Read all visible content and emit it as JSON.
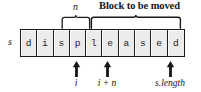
{
  "figure": {
    "kind": "string-array-block-diagram",
    "string_label": "s",
    "string_value": "displeased",
    "cells": [
      {
        "index": 0,
        "char": "d"
      },
      {
        "index": 1,
        "char": "i"
      },
      {
        "index": 2,
        "char": "s"
      },
      {
        "index": 3,
        "char": "p"
      },
      {
        "index": 4,
        "char": "l"
      },
      {
        "index": 5,
        "char": "e"
      },
      {
        "index": 6,
        "char": "a"
      },
      {
        "index": 7,
        "char": "s"
      },
      {
        "index": 8,
        "char": "e"
      },
      {
        "index": 9,
        "char": "d"
      }
    ],
    "braces": [
      {
        "name": "n-span",
        "label": "n",
        "style": "italic",
        "spans_cells": [
          3,
          4
        ]
      },
      {
        "name": "block-span",
        "label": "Block to be moved",
        "style": "bold",
        "spans_cells": [
          5,
          6,
          7,
          8,
          9
        ]
      }
    ],
    "markers": [
      {
        "name": "i",
        "label": "i",
        "at_cell_boundary": 3
      },
      {
        "name": "i-plus-n",
        "label": "i + n",
        "at_cell_boundary": 5
      },
      {
        "name": "s-length",
        "label": "s.length",
        "at_cell_boundary": 10
      }
    ],
    "colors": {
      "cell_fill": "#ebebeb",
      "cell_stroke": "#1a1a1a",
      "cell_highlight": "#fbfbfb",
      "text": "#161616",
      "background": "#ffffff"
    }
  }
}
